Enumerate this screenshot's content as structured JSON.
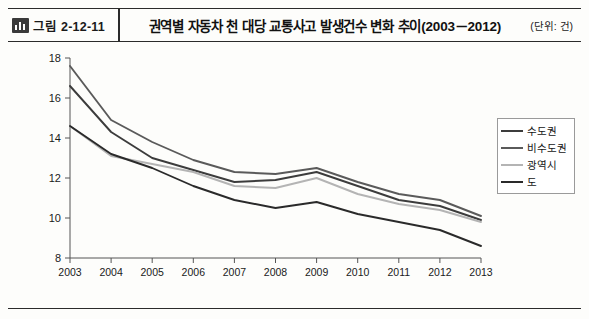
{
  "header": {
    "figure_label": "그림 2-12-11",
    "figure_icon": "bar-chart-icon",
    "title": "권역별 자동차 천 대당 교통사고 발생건수 변화 추이(2003－2012)",
    "unit": "(단위: 건)"
  },
  "chart_data": {
    "type": "line",
    "title": "권역별 자동차 천 대당 교통사고 발생건수 변화 추이(2003－2012)",
    "xlabel": "",
    "ylabel": "",
    "unit": "건",
    "x": [
      "2003",
      "2004",
      "2005",
      "2006",
      "2007",
      "2008",
      "2009",
      "2010",
      "2011",
      "2012",
      "2013"
    ],
    "ylim": [
      8,
      18
    ],
    "yticks": [
      8,
      10,
      12,
      14,
      16,
      18
    ],
    "grid": false,
    "legend_position": "right",
    "series": [
      {
        "name": "수도권",
        "color": "#3c3c3c",
        "values": [
          16.6,
          14.3,
          13.0,
          12.4,
          11.8,
          11.9,
          12.3,
          11.6,
          10.9,
          10.6,
          9.9
        ]
      },
      {
        "name": "비수도권",
        "color": "#5a5a5a",
        "values": [
          17.6,
          14.9,
          13.8,
          12.9,
          12.3,
          12.2,
          12.5,
          11.8,
          11.2,
          10.9,
          10.1
        ]
      },
      {
        "name": "광역시",
        "color": "#b4b4b4",
        "values": [
          14.6,
          13.1,
          12.7,
          12.3,
          11.6,
          11.5,
          12.0,
          11.2,
          10.7,
          10.4,
          9.8
        ]
      },
      {
        "name": "도",
        "color": "#2a2a2a",
        "values": [
          14.6,
          13.2,
          12.5,
          11.6,
          10.9,
          10.5,
          10.8,
          10.2,
          9.8,
          9.4,
          8.6
        ]
      }
    ]
  },
  "legend": {
    "items": [
      {
        "label": "수도권",
        "color": "#3c3c3c"
      },
      {
        "label": "비수도권",
        "color": "#5a5a5a"
      },
      {
        "label": "광역시",
        "color": "#b4b4b4"
      },
      {
        "label": "도",
        "color": "#2a2a2a"
      }
    ]
  }
}
